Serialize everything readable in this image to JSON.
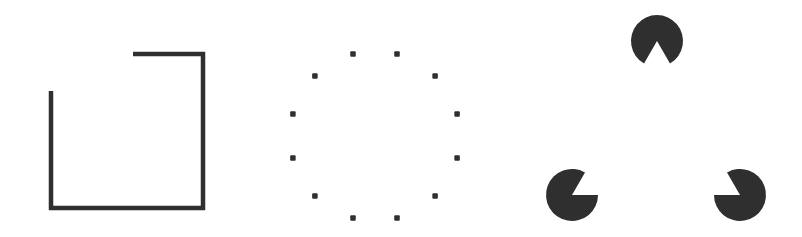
{
  "figure": {
    "colors": {
      "ink": "#2f2f2f",
      "background": "#ffffff"
    },
    "panels": [
      {
        "name": "incomplete-square",
        "segments": [
          {
            "x1": 133,
            "y1": 54,
            "x2": 203,
            "y2": 54
          },
          {
            "x1": 203,
            "y1": 54,
            "x2": 203,
            "y2": 208
          },
          {
            "x1": 203,
            "y1": 208,
            "x2": 51,
            "y2": 208
          },
          {
            "x1": 51,
            "y1": 208,
            "x2": 51,
            "y2": 91
          }
        ],
        "stroke_width": 4.5
      },
      {
        "name": "dotted-circle",
        "center": [
          375,
          136
        ],
        "radius": 85,
        "dot_count": 12,
        "dot_size": 5.5
      },
      {
        "name": "illusory-triangle",
        "pacmen": [
          {
            "cx": 657,
            "cy": 41,
            "r": 26,
            "mouth_start": 60,
            "mouth_end": 120
          },
          {
            "cx": 572,
            "cy": 195,
            "r": 26,
            "mouth_start": -60,
            "mouth_end": 0
          },
          {
            "cx": 740,
            "cy": 195,
            "r": 26,
            "mouth_start": 180,
            "mouth_end": 240
          }
        ]
      }
    ]
  }
}
